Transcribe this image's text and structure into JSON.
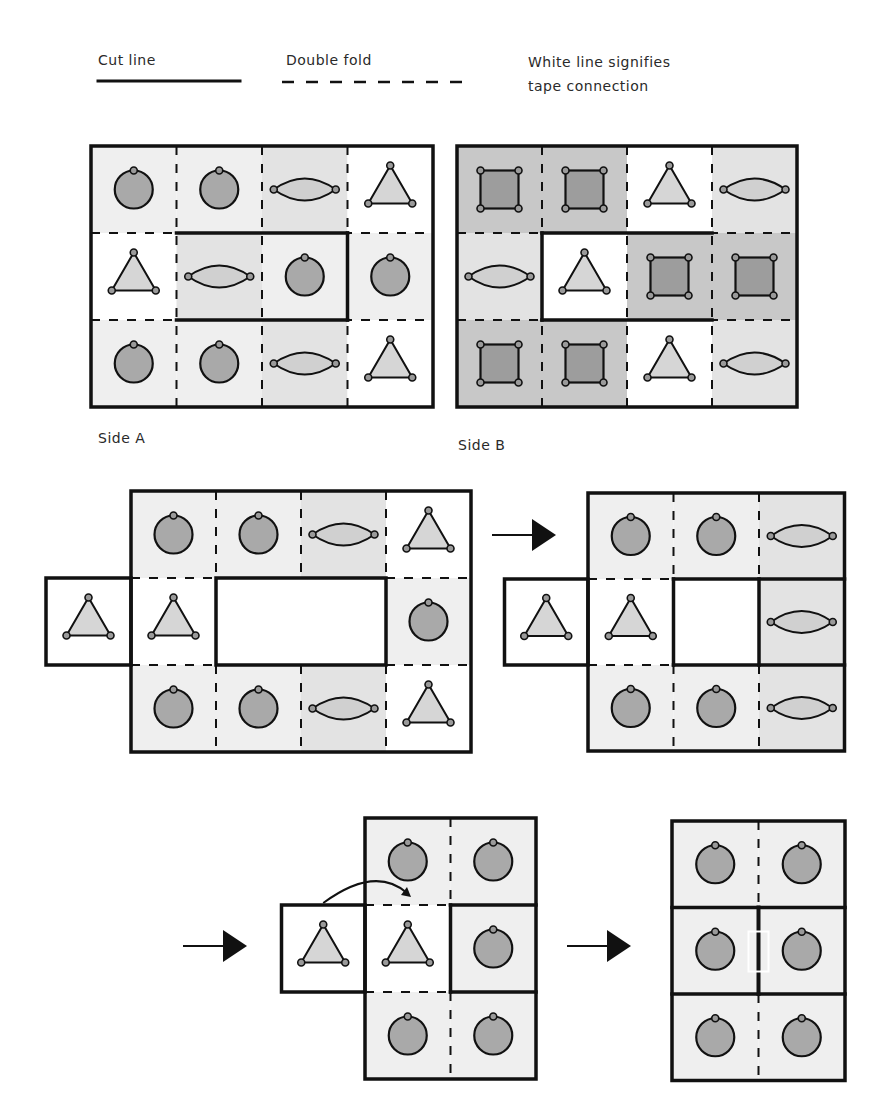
{
  "legend": {
    "cut_line_label": "Cut line",
    "double_fold_label": "Double fold",
    "tape_label_line1": "White line signifies",
    "tape_label_line2": "tape connection"
  },
  "side_a_label": "Side A",
  "side_b_label": "Side B",
  "colors": {
    "cell_light": "#efefef",
    "cell_mid": "#e3e3e3",
    "cell_dark": "#c8c8c8",
    "cell_white": "#ffffff",
    "circle_fill": "#a9a9a9",
    "lens_fill": "#d0d0d0",
    "triangle_fill": "#d6d6d6",
    "square_fill": "#9d9d9d",
    "stroke": "#111111"
  },
  "side_a_grid": [
    [
      {
        "shape": "circle",
        "bg": "light"
      },
      {
        "shape": "circle",
        "bg": "light"
      },
      {
        "shape": "lens",
        "bg": "mid"
      },
      {
        "shape": "triangle",
        "bg": "white"
      }
    ],
    [
      {
        "shape": "triangle",
        "bg": "white"
      },
      {
        "shape": "lens",
        "bg": "mid"
      },
      {
        "shape": "circle",
        "bg": "light"
      },
      {
        "shape": "circle",
        "bg": "light"
      }
    ],
    [
      {
        "shape": "circle",
        "bg": "light"
      },
      {
        "shape": "circle",
        "bg": "light"
      },
      {
        "shape": "lens",
        "bg": "mid"
      },
      {
        "shape": "triangle",
        "bg": "white"
      }
    ]
  ],
  "side_b_grid": [
    [
      {
        "shape": "square",
        "bg": "dark"
      },
      {
        "shape": "square",
        "bg": "dark"
      },
      {
        "shape": "triangle",
        "bg": "white"
      },
      {
        "shape": "lens",
        "bg": "mid"
      }
    ],
    [
      {
        "shape": "lens",
        "bg": "mid"
      },
      {
        "shape": "triangle",
        "bg": "white"
      },
      {
        "shape": "square",
        "bg": "dark"
      },
      {
        "shape": "square",
        "bg": "dark"
      }
    ],
    [
      {
        "shape": "square",
        "bg": "dark"
      },
      {
        "shape": "square",
        "bg": "dark"
      },
      {
        "shape": "triangle",
        "bg": "white"
      },
      {
        "shape": "lens",
        "bg": "mid"
      }
    ]
  ],
  "steps": [
    {
      "step": 1,
      "description": "Cut out center, fold flap out"
    },
    {
      "step": 2,
      "description": "Fold right column inward"
    },
    {
      "step": 3,
      "description": "Fold triangle flap over (curved arrow)"
    },
    {
      "step": 4,
      "description": "Final: six circles, tape connection shown as white line"
    }
  ]
}
